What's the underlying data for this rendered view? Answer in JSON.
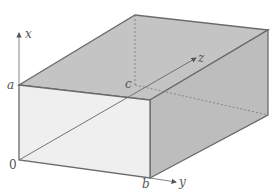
{
  "figure": {
    "type": "rectangular box (cuboid) in 3D coordinates",
    "axes": {
      "x": "x",
      "y": "y",
      "z": "z"
    },
    "labels": {
      "origin": "0",
      "a": "a",
      "b": "b",
      "c": "c"
    },
    "colors": {
      "top_face": "#c4c4c4",
      "right_face": "#bdbdbd",
      "front_face": "#ededed",
      "edges": "#6a6a6a",
      "text": "#555555"
    }
  }
}
